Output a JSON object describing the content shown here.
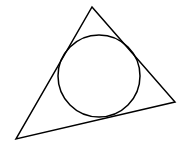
{
  "diagram": {
    "stroke_color": "#000000",
    "background": "#ffffff",
    "stroke_width": 1.5,
    "triangle": {
      "vertices": [
        [
          92,
          7
        ],
        [
          175,
          102
        ],
        [
          16,
          139
        ]
      ]
    },
    "circle": {
      "cx": 99,
      "cy": 76,
      "r": 41
    }
  }
}
